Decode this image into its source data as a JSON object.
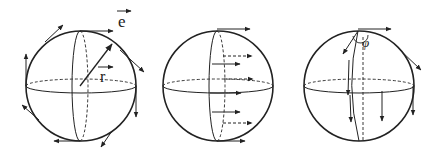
{
  "figure": {
    "colors": {
      "stroke": "#222222",
      "background": "#ffffff"
    },
    "panels": [
      {
        "id": "sphere-1",
        "labels": {
          "e_vector": "e",
          "r_vector": "r"
        },
        "content": "Sphere with radius vector r and tangent vectors e at several points on the boundary"
      },
      {
        "id": "sphere-2",
        "labels": {},
        "content": "Sphere with parallel horizontal vectors along a meridian (solid front, dashed back)"
      },
      {
        "id": "sphere-3",
        "labels": {
          "angle": "φ"
        },
        "content": "Sphere with angle φ at the north pole and downward-pointing vectors"
      }
    ]
  }
}
